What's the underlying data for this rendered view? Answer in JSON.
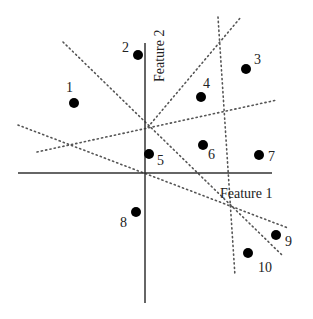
{
  "axes": {
    "x_label": "Feature 1",
    "y_label": "Feature 2",
    "x_axis": {
      "x1": 18,
      "y1": 173,
      "x2": 272,
      "y2": 173
    },
    "y_axis": {
      "x1": 145,
      "y1": 43,
      "x2": 145,
      "y2": 303
    }
  },
  "points": [
    {
      "id": "1",
      "cx": 74,
      "cy": 103,
      "lx": 66,
      "ly": 92
    },
    {
      "id": "2",
      "cx": 138,
      "cy": 55,
      "lx": 122,
      "ly": 52
    },
    {
      "id": "3",
      "cx": 246,
      "cy": 69,
      "lx": 254,
      "ly": 64
    },
    {
      "id": "4",
      "cx": 201,
      "cy": 97,
      "lx": 203,
      "ly": 88
    },
    {
      "id": "5",
      "cx": 149,
      "cy": 154,
      "lx": 157,
      "ly": 165
    },
    {
      "id": "6",
      "cx": 203,
      "cy": 145,
      "lx": 208,
      "ly": 159
    },
    {
      "id": "7",
      "cx": 259,
      "cy": 155,
      "lx": 268,
      "ly": 161
    },
    {
      "id": "8",
      "cx": 136,
      "cy": 212,
      "lx": 120,
      "ly": 227
    },
    {
      "id": "9",
      "cx": 276,
      "cy": 235,
      "lx": 285,
      "ly": 246
    },
    {
      "id": "10",
      "cx": 248,
      "cy": 253,
      "lx": 258,
      "ly": 272
    }
  ],
  "dotted_lines": [
    {
      "x1": 63,
      "y1": 42,
      "x2": 283,
      "y2": 256
    },
    {
      "x1": 148,
      "y1": 127,
      "x2": 241,
      "y2": 17
    },
    {
      "x1": 18,
      "y1": 125,
      "x2": 288,
      "y2": 228
    },
    {
      "x1": 37,
      "y1": 152,
      "x2": 277,
      "y2": 100
    },
    {
      "x1": 218,
      "y1": 17,
      "x2": 235,
      "y2": 276
    }
  ]
}
